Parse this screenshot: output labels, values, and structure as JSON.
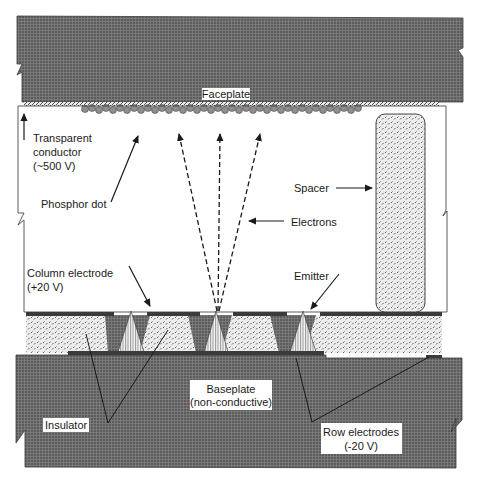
{
  "diagram": {
    "type": "cross-section",
    "colors": {
      "plate_fill": "#5a5a5a",
      "plate_grid": "#7a7a7a",
      "insulator_fill": "#e6e6e6",
      "spacer_fill": "#e0e0e0",
      "electrode": "#3a3a3a",
      "phosphor": "#8c8c8c",
      "emitter_fill": "#f2f2f2",
      "gate_fill": "#5a5a5a",
      "background": "#ffffff",
      "text": "#1a1a1a"
    },
    "labels": {
      "faceplate": "Faceplate",
      "transparent_conductor_line1": "Transparent",
      "transparent_conductor_line2": "conductor",
      "transparent_conductor_line3": "(~500 V)",
      "phosphor_dot": "Phosphor dot",
      "spacer": "Spacer",
      "electrons": "Electrons",
      "column_electrode_line1": "Column electrode",
      "column_electrode_line2": "(+20 V)",
      "emitter": "Emitter",
      "baseplate_line1": "Baseplate",
      "baseplate_line2": "(non-conductive)",
      "insulator": "Insulator",
      "row_electrodes_line1": "Row electrodes",
      "row_electrodes_line2": "(-20 V)"
    },
    "components": [
      {
        "id": "faceplate",
        "label": "Faceplate"
      },
      {
        "id": "transparent-conductor",
        "label": "Transparent conductor",
        "voltage": "~500 V"
      },
      {
        "id": "phosphor-dots",
        "label": "Phosphor dot"
      },
      {
        "id": "spacer",
        "label": "Spacer"
      },
      {
        "id": "electrons",
        "label": "Electrons",
        "beam_count": 3
      },
      {
        "id": "column-electrode",
        "label": "Column electrode",
        "voltage": "+20 V"
      },
      {
        "id": "emitters",
        "label": "Emitter",
        "count": 4
      },
      {
        "id": "insulator",
        "label": "Insulator"
      },
      {
        "id": "baseplate",
        "label": "Baseplate",
        "note": "non-conductive"
      },
      {
        "id": "row-electrodes",
        "label": "Row electrodes",
        "voltage": "-20 V"
      }
    ]
  }
}
